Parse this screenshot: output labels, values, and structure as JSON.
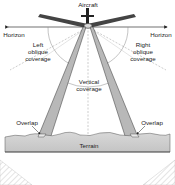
{
  "diagram": {
    "labels": {
      "aircraft": "Aircraft",
      "horizon_left": "Horizon",
      "horizon_right": "Horizon",
      "left_oblique_1": "Left",
      "left_oblique_2": "oblique",
      "left_oblique_3": "coverage",
      "right_oblique_1": "Right",
      "right_oblique_2": "oblique",
      "right_oblique_3": "coverage",
      "vertical_1": "Vertical",
      "vertical_2": "coverage",
      "overlap_left": "Overlap",
      "overlap_right": "Overlap",
      "terrain": "Terrain"
    },
    "colors": {
      "beam": "#b8b8b8",
      "terrain": "#cfcfcf",
      "line": "#333333",
      "dashed": "#999999"
    }
  }
}
